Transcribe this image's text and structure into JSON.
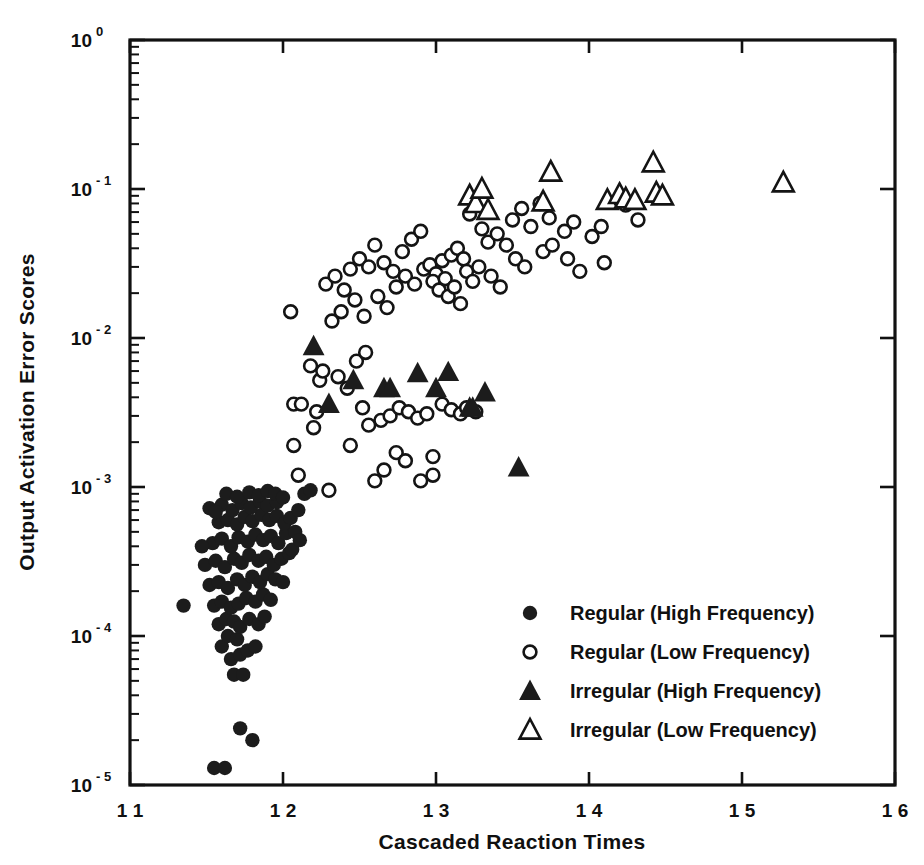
{
  "chart_data": {
    "type": "scatter",
    "title": "",
    "xlabel": "Cascaded Reaction Times",
    "ylabel": "Output Activation Error Scores",
    "xlim": [
      11,
      16
    ],
    "ylim": [
      1e-05,
      1
    ],
    "xscale": "linear",
    "yscale": "log",
    "grid": false,
    "legend_position": "lower-right-inside",
    "xticks": [
      "11",
      "12",
      "13",
      "14",
      "15",
      "16"
    ],
    "yticks": [
      "10 0",
      "10 -1",
      "10 -2",
      "10 -3",
      "10 -4",
      "10 -5"
    ],
    "ytick_mantissa": "10",
    "ytick_exponents": [
      "0",
      "-1",
      "-2",
      "-3",
      "-4",
      "-5"
    ],
    "series": [
      {
        "name": "Regular (High Frequency)",
        "marker": "filled-circle",
        "color": "#1c1c1c",
        "points": [
          [
            11.35,
            0.00016
          ],
          [
            11.55,
            1.3e-05
          ],
          [
            11.62,
            1.3e-05
          ],
          [
            11.72,
            2.4e-05
          ],
          [
            11.8,
            2e-05
          ],
          [
            11.68,
            5.5e-05
          ],
          [
            11.74,
            5.5e-05
          ],
          [
            11.66,
            7e-05
          ],
          [
            11.72,
            7.5e-05
          ],
          [
            11.6,
            8.5e-05
          ],
          [
            11.64,
            0.0001
          ],
          [
            11.7,
            9.5e-05
          ],
          [
            11.77,
            8e-05
          ],
          [
            11.82,
            8.5e-05
          ],
          [
            11.58,
            0.00012
          ],
          [
            11.63,
            0.00013
          ],
          [
            11.68,
            0.000125
          ],
          [
            11.72,
            0.000115
          ],
          [
            11.78,
            0.00013
          ],
          [
            11.84,
            0.00012
          ],
          [
            11.88,
            0.000135
          ],
          [
            11.55,
            0.00016
          ],
          [
            11.6,
            0.00017
          ],
          [
            11.66,
            0.000155
          ],
          [
            11.71,
            0.000165
          ],
          [
            11.76,
            0.00018
          ],
          [
            11.82,
            0.00017
          ],
          [
            11.87,
            0.00019
          ],
          [
            11.92,
            0.000175
          ],
          [
            11.52,
            0.00022
          ],
          [
            11.58,
            0.00023
          ],
          [
            11.64,
            0.00021
          ],
          [
            11.7,
            0.00024
          ],
          [
            11.75,
            0.00022
          ],
          [
            11.8,
            0.00025
          ],
          [
            11.85,
            0.00023
          ],
          [
            11.9,
            0.00026
          ],
          [
            11.95,
            0.00024
          ],
          [
            12.0,
            0.00023
          ],
          [
            11.49,
            0.0003
          ],
          [
            11.56,
            0.00032
          ],
          [
            11.62,
            0.00029
          ],
          [
            11.68,
            0.00033
          ],
          [
            11.73,
            0.00031
          ],
          [
            11.78,
            0.00035
          ],
          [
            11.84,
            0.00032
          ],
          [
            11.89,
            0.00034
          ],
          [
            11.94,
            0.0003
          ],
          [
            11.99,
            0.00033
          ],
          [
            12.04,
            0.00036
          ],
          [
            11.54,
            0.00042
          ],
          [
            11.6,
            0.00045
          ],
          [
            11.66,
            0.0004
          ],
          [
            11.71,
            0.00046
          ],
          [
            11.77,
            0.00043
          ],
          [
            11.82,
            0.00048
          ],
          [
            11.87,
            0.00044
          ],
          [
            11.92,
            0.00047
          ],
          [
            11.97,
            0.00042
          ],
          [
            12.02,
            0.00049
          ],
          [
            11.58,
            0.00058
          ],
          [
            11.64,
            0.0006
          ],
          [
            11.7,
            0.00056
          ],
          [
            11.75,
            0.00063
          ],
          [
            11.8,
            0.00059
          ],
          [
            11.86,
            0.00065
          ],
          [
            11.91,
            0.0006
          ],
          [
            11.96,
            0.00064
          ],
          [
            12.01,
            0.00057
          ],
          [
            11.52,
            0.00072
          ],
          [
            11.6,
            0.00076
          ],
          [
            11.67,
            0.0007
          ],
          [
            11.73,
            0.00078
          ],
          [
            11.79,
            0.00073
          ],
          [
            11.85,
            0.0008
          ],
          [
            11.9,
            0.00075
          ],
          [
            11.96,
            0.00079
          ],
          [
            11.56,
            0.00068
          ],
          [
            11.63,
            0.0009
          ],
          [
            11.7,
            0.00086
          ],
          [
            11.78,
            0.00092
          ],
          [
            11.84,
            0.00088
          ],
          [
            11.9,
            0.00094
          ],
          [
            11.95,
            0.0009
          ],
          [
            12.0,
            0.00085
          ],
          [
            12.05,
            0.00062
          ],
          [
            12.08,
            0.0005
          ],
          [
            12.1,
            0.0007
          ],
          [
            12.14,
            0.0009
          ],
          [
            12.18,
            0.00095
          ],
          [
            12.06,
            0.00038
          ],
          [
            12.11,
            0.00044
          ],
          [
            11.47,
            0.0004
          ]
        ]
      },
      {
        "name": "Regular (Low Frequency)",
        "marker": "open-circle",
        "color": "#141414",
        "points": [
          [
            12.05,
            0.015
          ],
          [
            12.07,
            0.0019
          ],
          [
            12.07,
            0.0036
          ],
          [
            12.12,
            0.0036
          ],
          [
            12.1,
            0.0012
          ],
          [
            12.22,
            0.0032
          ],
          [
            12.24,
            0.0052
          ],
          [
            12.2,
            0.0025
          ],
          [
            12.28,
            0.023
          ],
          [
            12.34,
            0.026
          ],
          [
            12.4,
            0.021
          ],
          [
            12.32,
            0.013
          ],
          [
            12.38,
            0.015
          ],
          [
            12.44,
            0.029
          ],
          [
            12.5,
            0.034
          ],
          [
            12.56,
            0.03
          ],
          [
            12.47,
            0.018
          ],
          [
            12.53,
            0.014
          ],
          [
            12.6,
            0.042
          ],
          [
            12.66,
            0.032
          ],
          [
            12.72,
            0.028
          ],
          [
            12.62,
            0.019
          ],
          [
            12.68,
            0.016
          ],
          [
            12.74,
            0.022
          ],
          [
            12.78,
            0.038
          ],
          [
            12.84,
            0.046
          ],
          [
            12.9,
            0.052
          ],
          [
            12.8,
            0.026
          ],
          [
            12.86,
            0.023
          ],
          [
            12.92,
            0.029
          ],
          [
            12.96,
            0.031
          ],
          [
            13.0,
            0.027
          ],
          [
            13.04,
            0.033
          ],
          [
            12.98,
            0.024
          ],
          [
            13.02,
            0.021
          ],
          [
            13.06,
            0.025
          ],
          [
            13.08,
            0.019
          ],
          [
            13.12,
            0.022
          ],
          [
            13.16,
            0.017
          ],
          [
            13.1,
            0.036
          ],
          [
            13.14,
            0.04
          ],
          [
            13.18,
            0.034
          ],
          [
            13.2,
            0.028
          ],
          [
            13.24,
            0.024
          ],
          [
            13.28,
            0.03
          ],
          [
            13.22,
            0.068
          ],
          [
            13.3,
            0.054
          ],
          [
            13.34,
            0.044
          ],
          [
            13.4,
            0.05
          ],
          [
            13.46,
            0.042
          ],
          [
            13.36,
            0.026
          ],
          [
            13.42,
            0.022
          ],
          [
            13.5,
            0.062
          ],
          [
            13.56,
            0.074
          ],
          [
            13.62,
            0.056
          ],
          [
            13.52,
            0.034
          ],
          [
            13.58,
            0.03
          ],
          [
            13.68,
            0.08
          ],
          [
            13.74,
            0.064
          ],
          [
            13.7,
            0.038
          ],
          [
            13.76,
            0.042
          ],
          [
            13.84,
            0.052
          ],
          [
            13.9,
            0.06
          ],
          [
            13.86,
            0.034
          ],
          [
            13.94,
            0.028
          ],
          [
            14.02,
            0.048
          ],
          [
            14.08,
            0.056
          ],
          [
            14.1,
            0.032
          ],
          [
            14.24,
            0.078
          ],
          [
            14.32,
            0.062
          ],
          [
            12.6,
            0.0011
          ],
          [
            12.66,
            0.0013
          ],
          [
            12.64,
            0.0028
          ],
          [
            12.7,
            0.003
          ],
          [
            12.76,
            0.0034
          ],
          [
            12.82,
            0.0032
          ],
          [
            12.88,
            0.0029
          ],
          [
            12.94,
            0.0031
          ],
          [
            12.52,
            0.0034
          ],
          [
            12.56,
            0.0026
          ],
          [
            13.04,
            0.0036
          ],
          [
            13.1,
            0.0033
          ],
          [
            13.16,
            0.0031
          ],
          [
            13.2,
            0.0034
          ],
          [
            12.74,
            0.0017
          ],
          [
            12.8,
            0.0015
          ],
          [
            12.98,
            0.0016
          ],
          [
            12.98,
            0.0012
          ],
          [
            12.44,
            0.0019
          ],
          [
            12.9,
            0.0011
          ],
          [
            12.3,
            0.00095
          ],
          [
            12.36,
            0.0055
          ],
          [
            12.42,
            0.0046
          ],
          [
            12.18,
            0.0065
          ],
          [
            12.26,
            0.006
          ],
          [
            13.26,
            0.0032
          ],
          [
            12.48,
            0.007
          ],
          [
            12.54,
            0.008
          ]
        ]
      },
      {
        "name": "Irregular (High Frequency)",
        "marker": "filled-triangle",
        "color": "#1c1c1c",
        "points": [
          [
            12.2,
            0.0088
          ],
          [
            12.46,
            0.0052
          ],
          [
            12.3,
            0.0036
          ],
          [
            12.66,
            0.0046
          ],
          [
            12.7,
            0.0046
          ],
          [
            12.88,
            0.0058
          ],
          [
            13.0,
            0.0046
          ],
          [
            13.08,
            0.0059
          ],
          [
            13.22,
            0.0034
          ],
          [
            13.24,
            0.0034
          ],
          [
            13.32,
            0.0043
          ],
          [
            13.54,
            0.00135
          ]
        ]
      },
      {
        "name": "Irregular (Low Frequency)",
        "marker": "open-triangle",
        "color": "#141414",
        "points": [
          [
            13.22,
            0.09
          ],
          [
            13.26,
            0.08
          ],
          [
            13.3,
            0.1
          ],
          [
            13.34,
            0.072
          ],
          [
            13.75,
            0.13
          ],
          [
            13.7,
            0.082
          ],
          [
            14.12,
            0.084
          ],
          [
            14.2,
            0.092
          ],
          [
            14.24,
            0.086
          ],
          [
            14.3,
            0.084
          ],
          [
            14.42,
            0.15
          ],
          [
            14.44,
            0.094
          ],
          [
            14.48,
            0.09
          ],
          [
            15.27,
            0.11
          ]
        ]
      }
    ]
  },
  "legend": {
    "entries": [
      {
        "label": "Regular (High Frequency)",
        "marker": "filled-circle"
      },
      {
        "label": "Regular (Low Frequency)",
        "marker": "open-circle"
      },
      {
        "label": "Irregular (High Frequency)",
        "marker": "filled-triangle"
      },
      {
        "label": "Irregular (Low Frequency)",
        "marker": "open-triangle"
      }
    ]
  }
}
